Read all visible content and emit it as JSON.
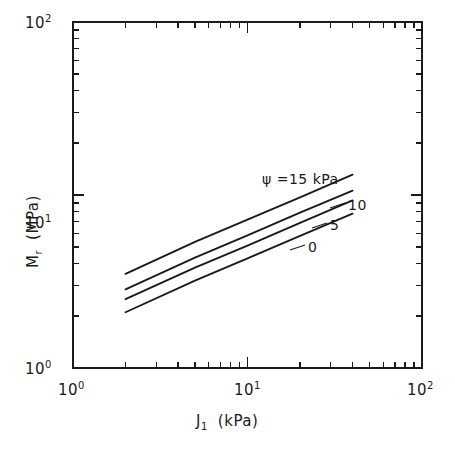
{
  "figure": {
    "background_color": "#ffffff",
    "ink_color": "#1a1a1a"
  },
  "axes": {
    "x": {
      "title_main": "J",
      "title_sub": "1",
      "title_unit": "(kPa)",
      "title_full": "J1  (kPa)",
      "scale": "log",
      "ticks": [
        {
          "value": 1,
          "mantissa": "10",
          "exponent": "0"
        },
        {
          "value": 10,
          "mantissa": "10",
          "exponent": "1"
        },
        {
          "value": 100,
          "mantissa": "10",
          "exponent": "2"
        }
      ]
    },
    "y": {
      "title_main": "M",
      "title_sub": "r",
      "title_unit": "(MPa)",
      "title_full": "Mr  (MPa)",
      "scale": "log",
      "ticks": [
        {
          "value": 1,
          "mantissa": "10",
          "exponent": "0"
        },
        {
          "value": 10,
          "mantissa": "10",
          "exponent": "1"
        },
        {
          "value": 100,
          "mantissa": "10",
          "exponent": "2"
        }
      ]
    }
  },
  "curve_labels": {
    "psi15": "ψ =15 kPa",
    "psi10": "10",
    "psi5": "5",
    "psi0": "0"
  },
  "chart_data": {
    "type": "line",
    "title": "",
    "xlabel": "J1  (kPa)",
    "ylabel": "Mr  (MPa)",
    "xscale": "log",
    "yscale": "log",
    "xlim": [
      1,
      100
    ],
    "ylim": [
      1,
      100
    ],
    "grid": false,
    "legend": "inline-end-labels",
    "series": [
      {
        "name": "ψ =15 kPa",
        "psi_kPa": 15,
        "x": [
          2,
          5,
          10,
          20,
          40
        ],
        "y": [
          3.5,
          5.35,
          7.2,
          9.7,
          13.1
        ],
        "label": "ψ =15 kPa"
      },
      {
        "name": "10",
        "psi_kPa": 10,
        "x": [
          2,
          5,
          10,
          20,
          40
        ],
        "y": [
          2.85,
          4.35,
          5.85,
          7.9,
          10.6
        ],
        "label": "10"
      },
      {
        "name": "5",
        "psi_kPa": 5,
        "x": [
          2,
          5,
          10,
          20,
          40
        ],
        "y": [
          2.5,
          3.8,
          5.1,
          6.9,
          9.3
        ],
        "label": "5"
      },
      {
        "name": "0",
        "psi_kPa": 0,
        "x": [
          2,
          5,
          10,
          20,
          40
        ],
        "y": [
          2.1,
          3.2,
          4.3,
          5.8,
          7.8
        ],
        "label": "0"
      }
    ]
  }
}
